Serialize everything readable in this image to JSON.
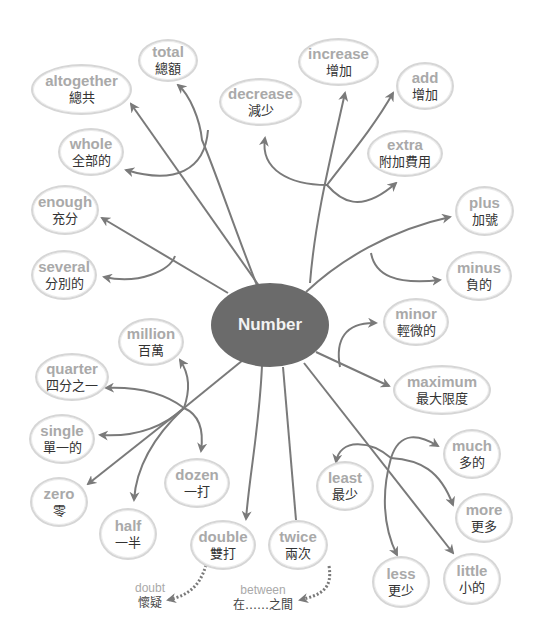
{
  "diagram": {
    "type": "mind-map",
    "center": {
      "label": "Number",
      "color": "#6b6b6b"
    },
    "colors": {
      "line": "#7a7a7a",
      "node_border": "#d6d6d6",
      "english_text": "#a9a9a9",
      "chinese_text": "#333333"
    },
    "nodes": [
      {
        "id": "total",
        "en": "total",
        "zh": "總額"
      },
      {
        "id": "altogether",
        "en": "altogether",
        "zh": "總共"
      },
      {
        "id": "whole",
        "en": "whole",
        "zh": "全部的"
      },
      {
        "id": "enough",
        "en": "enough",
        "zh": "充分"
      },
      {
        "id": "several",
        "en": "several",
        "zh": "分別的"
      },
      {
        "id": "decrease",
        "en": "decrease",
        "zh": "減少"
      },
      {
        "id": "increase",
        "en": "increase",
        "zh": "增加"
      },
      {
        "id": "add",
        "en": "add",
        "zh": "增加"
      },
      {
        "id": "extra",
        "en": "extra",
        "zh": "附加費用"
      },
      {
        "id": "plus",
        "en": "plus",
        "zh": "加號"
      },
      {
        "id": "minus",
        "en": "minus",
        "zh": "負的"
      },
      {
        "id": "minor",
        "en": "minor",
        "zh": "輕微的"
      },
      {
        "id": "maximum",
        "en": "maximum",
        "zh": "最大限度"
      },
      {
        "id": "million",
        "en": "million",
        "zh": "百萬"
      },
      {
        "id": "quarter",
        "en": "quarter",
        "zh": "四分之一"
      },
      {
        "id": "single",
        "en": "single",
        "zh": "單一的"
      },
      {
        "id": "zero",
        "en": "zero",
        "zh": "零"
      },
      {
        "id": "half",
        "en": "half",
        "zh": "一半"
      },
      {
        "id": "dozen",
        "en": "dozen",
        "zh": "一打"
      },
      {
        "id": "double",
        "en": "double",
        "zh": "雙打"
      },
      {
        "id": "twice",
        "en": "twice",
        "zh": "兩次"
      },
      {
        "id": "much",
        "en": "much",
        "zh": "多的"
      },
      {
        "id": "least",
        "en": "least",
        "zh": "最少"
      },
      {
        "id": "more",
        "en": "more",
        "zh": "更多"
      },
      {
        "id": "less",
        "en": "less",
        "zh": "更少"
      },
      {
        "id": "little",
        "en": "little",
        "zh": "小的"
      }
    ],
    "extras": [
      {
        "id": "doubt",
        "en": "doubt",
        "zh": "懷疑"
      },
      {
        "id": "between",
        "en": "between",
        "zh": "在……之間"
      }
    ]
  }
}
